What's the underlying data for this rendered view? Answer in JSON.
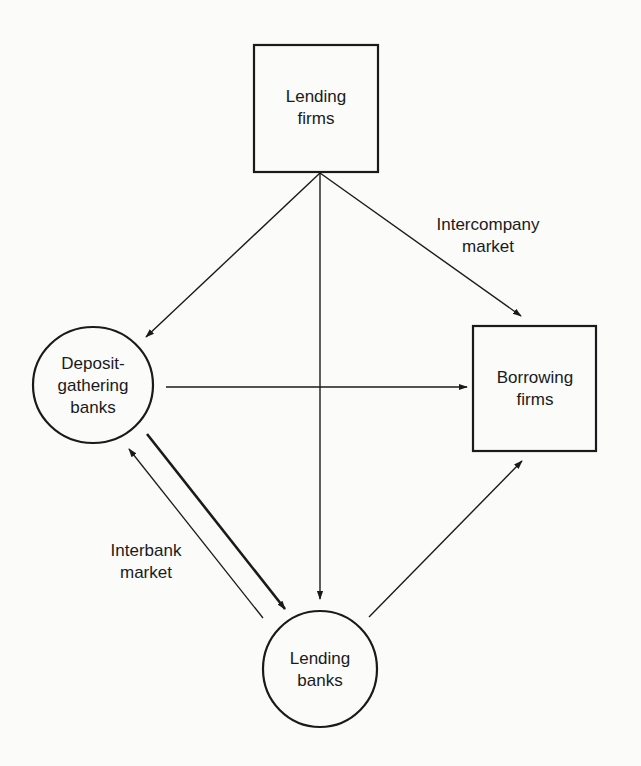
{
  "diagram": {
    "nodes": {
      "lending_firms": {
        "shape": "rectangle",
        "lines": [
          "Lending",
          "firms"
        ]
      },
      "borrowing_firms": {
        "shape": "rectangle",
        "lines": [
          "Borrowing",
          "firms"
        ]
      },
      "deposit_banks": {
        "shape": "circle",
        "lines": [
          "Deposit-",
          "gathering",
          "banks"
        ]
      },
      "lending_banks": {
        "shape": "circle",
        "lines": [
          "Lending",
          "banks"
        ]
      }
    },
    "labels": {
      "intercompany": [
        "Intercompany",
        "market"
      ],
      "interbank": [
        "Interbank",
        "market"
      ]
    },
    "edges": [
      {
        "from": "Lending firms",
        "to": "Deposit-gathering banks"
      },
      {
        "from": "Lending firms",
        "to": "Lending banks"
      },
      {
        "from": "Lending firms",
        "to": "Borrowing firms",
        "label": "Intercompany market"
      },
      {
        "from": "Deposit-gathering banks",
        "to": "Borrowing firms"
      },
      {
        "from": "Deposit-gathering banks",
        "to": "Lending banks",
        "label": "Interbank market",
        "weight": "thick"
      },
      {
        "from": "Lending banks",
        "to": "Deposit-gathering banks",
        "label": "Interbank market"
      },
      {
        "from": "Lending banks",
        "to": "Borrowing firms"
      }
    ],
    "colors": {
      "ink": "#1a1a1a",
      "background": "#fbfbfa"
    }
  }
}
